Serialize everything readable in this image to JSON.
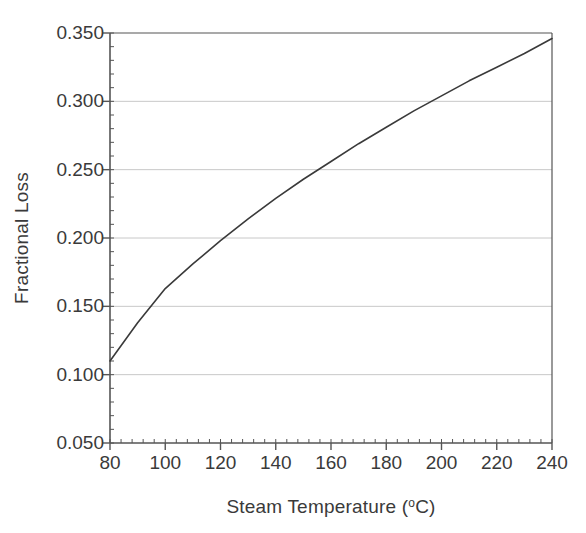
{
  "chart_data": {
    "type": "line",
    "title": "",
    "xlabel": "Steam Temperature (°C)",
    "xlabel_main": "Steam Temperature (",
    "xlabel_unit": "o",
    "xlabel_tail": "C)",
    "ylabel": "Fractional Loss",
    "xlim": [
      80,
      240
    ],
    "ylim": [
      0.05,
      0.35
    ],
    "xticks": [
      80,
      100,
      120,
      140,
      160,
      180,
      200,
      220,
      240
    ],
    "xtick_labels": [
      "80",
      "100",
      "120",
      "140",
      "160",
      "180",
      "200",
      "220",
      "240"
    ],
    "yticks": [
      0.05,
      0.1,
      0.15,
      0.2,
      0.25,
      0.3,
      0.35
    ],
    "ytick_labels": [
      "0.050",
      "0.100",
      "0.150",
      "0.200",
      "0.250",
      "0.300",
      "0.350"
    ],
    "x_minor_tick_step": 4,
    "y_minor_tick_step": 0.01,
    "grid": "horizontal",
    "grid_color": "#c8c8c8",
    "axis_color": "#555555",
    "line_color": "#3a3a3a",
    "legend": null,
    "series": [
      {
        "name": "Fractional Loss",
        "x": [
          80,
          90,
          100,
          110,
          120,
          130,
          140,
          150,
          160,
          170,
          180,
          190,
          200,
          210,
          220,
          230,
          240
        ],
        "values": [
          0.11,
          0.138,
          0.163,
          0.181,
          0.198,
          0.214,
          0.229,
          0.243,
          0.256,
          0.269,
          0.281,
          0.293,
          0.304,
          0.315,
          0.325,
          0.335,
          0.346
        ]
      }
    ],
    "annotations": []
  },
  "figure": {
    "plot_left_px": 110,
    "plot_right_px": 552,
    "plot_top_px": 33,
    "plot_bottom_px": 443
  }
}
